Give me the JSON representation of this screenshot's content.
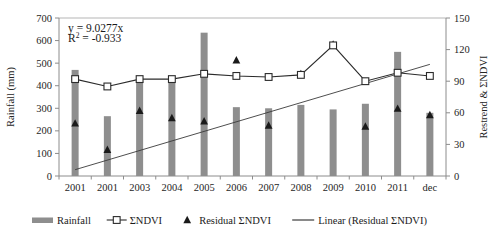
{
  "chart_data": {
    "type": "bar",
    "title": "",
    "subtitle": "",
    "xlabel": "",
    "ylabel": "Rainfall (mm)",
    "y2label": "Restrend & ΣNDVI",
    "grid": false,
    "legend_position": "bottom",
    "categories": [
      "2001",
      "2001",
      "2003",
      "2004",
      "2005",
      "2006",
      "2007",
      "2008",
      "2009",
      "2010",
      "2011",
      "dec"
    ],
    "ylim": [
      0,
      700
    ],
    "yticks": [
      0,
      100,
      200,
      300,
      400,
      500,
      600,
      700
    ],
    "ytick_labels": [
      "0",
      "100",
      "200",
      "300",
      "400",
      "500",
      "600",
      "700"
    ],
    "y2lim": [
      0,
      150
    ],
    "y2ticks": [
      0,
      30,
      60,
      90,
      120,
      150
    ],
    "y2tick_labels": [
      "0",
      "30",
      "60",
      "90",
      "120",
      "150"
    ],
    "annotations": [
      {
        "text": "y = 9.0277x",
        "x": 0.5,
        "y": 640
      },
      {
        "text": "R² = -0.933",
        "x": 0.5,
        "y": 595
      }
    ],
    "equation": "y = 9.0277x",
    "r_squared": "R² = -0.933",
    "series": [
      {
        "name": "Rainfall",
        "type": "bar",
        "axis": "left",
        "color": "#8e8e8e",
        "values": [
          470,
          265,
          420,
          415,
          635,
          305,
          300,
          315,
          295,
          320,
          550,
          280
        ]
      },
      {
        "name": "ΣNDVI",
        "type": "line",
        "axis": "right",
        "color": "#2b2b2b",
        "marker": "square-open",
        "values": [
          92,
          85,
          92,
          92,
          97,
          95,
          94,
          96,
          124,
          90,
          98,
          95
        ]
      },
      {
        "name": "Residual ΣNDVI",
        "type": "scatter",
        "axis": "right",
        "color": "#1a1a1a",
        "marker": "triangle",
        "values": [
          50,
          25,
          62,
          55,
          52,
          110,
          48,
          97,
          125,
          47,
          64,
          58
        ]
      },
      {
        "name": "Linear (Residual ΣNDVI)",
        "type": "line",
        "axis": "right",
        "color": "#3a3a3a",
        "trend": true,
        "endpoints": [
          [
            0,
            6
          ],
          [
            11,
            106
          ]
        ]
      }
    ]
  },
  "legend": {
    "items": [
      {
        "label": "Rainfall",
        "marker": "bar-swatch"
      },
      {
        "label": "ΣNDVI",
        "marker": "line-square"
      },
      {
        "label": "Residual ΣNDVI",
        "marker": "triangle"
      },
      {
        "label": "Linear (Residual ΣNDVI)",
        "marker": "line"
      }
    ]
  },
  "colors": {
    "bar": "#8e8e8e",
    "line": "#2b2b2b",
    "triangle": "#1a1a1a",
    "trend": "#3a3a3a",
    "axis": "#8c8c8c",
    "text": "#1a1a1a"
  }
}
